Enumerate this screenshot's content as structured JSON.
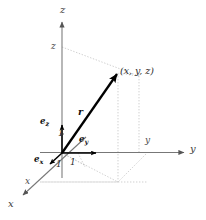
{
  "figure": {
    "kind": "3d-cartesian-coordinate-diagram",
    "background_color": "#ffffff",
    "axis_color": "#7a7a7a",
    "vector_color": "#000000",
    "dotted_color": "#b5b5b5",
    "width": 206,
    "height": 220
  },
  "axes": {
    "z_label": "z",
    "y_label": "y",
    "x_label": "x"
  },
  "coordinates": {
    "z_mark": "z",
    "y_mark": "y",
    "x_mark": "x"
  },
  "point": {
    "label": "(x, y, z)"
  },
  "vector": {
    "label": "r"
  },
  "basis": {
    "e_z": {
      "symbol": "e",
      "sub": "z",
      "magnitude": "1"
    },
    "e_y": {
      "symbol": "e",
      "sub": "y",
      "magnitude": "1"
    },
    "e_x": {
      "symbol": "e",
      "sub": "x",
      "magnitude": "1"
    }
  }
}
